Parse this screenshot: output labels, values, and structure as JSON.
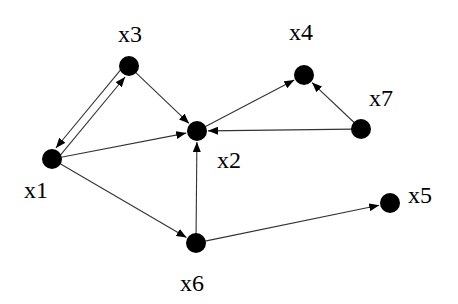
{
  "diagram": {
    "type": "directed-graph",
    "colors": {
      "node": "#000000",
      "edge": "#333333",
      "background": "#ffffff"
    },
    "nodes": [
      {
        "id": "x1",
        "label": "x1",
        "cx": 52,
        "cy": 159,
        "label_x": 24,
        "label_y": 178
      },
      {
        "id": "x2",
        "label": "x2",
        "cx": 197,
        "cy": 131,
        "label_x": 217,
        "label_y": 148
      },
      {
        "id": "x3",
        "label": "x3",
        "cx": 129,
        "cy": 66,
        "label_x": 118,
        "label_y": 22
      },
      {
        "id": "x4",
        "label": "x4",
        "cx": 304,
        "cy": 75,
        "label_x": 289,
        "label_y": 20
      },
      {
        "id": "x5",
        "label": "x5",
        "cx": 390,
        "cy": 203,
        "label_x": 408,
        "label_y": 183
      },
      {
        "id": "x6",
        "label": "x6",
        "cx": 196,
        "cy": 243,
        "label_x": 180,
        "label_y": 271
      },
      {
        "id": "x7",
        "label": "x7",
        "cx": 361,
        "cy": 129,
        "label_x": 369,
        "label_y": 86
      }
    ],
    "edges": [
      {
        "from": "x1",
        "to": "x3"
      },
      {
        "from": "x3",
        "to": "x1"
      },
      {
        "from": "x3",
        "to": "x2"
      },
      {
        "from": "x1",
        "to": "x2"
      },
      {
        "from": "x1",
        "to": "x6"
      },
      {
        "from": "x2",
        "to": "x4"
      },
      {
        "from": "x7",
        "to": "x4"
      },
      {
        "from": "x7",
        "to": "x2"
      },
      {
        "from": "x6",
        "to": "x2"
      },
      {
        "from": "x6",
        "to": "x5"
      }
    ]
  }
}
